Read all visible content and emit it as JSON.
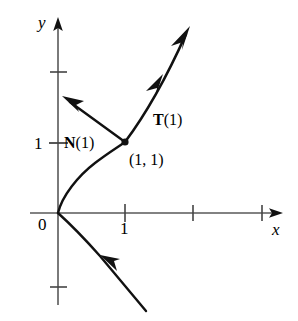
{
  "figure": {
    "background_color": "#ffffff",
    "ink_color": "#000000",
    "axis_color": "#595959",
    "axes": {
      "x_label": "x",
      "y_label": "y",
      "origin_label": "0",
      "x_ticks": [
        {
          "value": 1,
          "label": "1"
        },
        {
          "value": 2,
          "label": ""
        },
        {
          "value": 3,
          "label": ""
        }
      ],
      "y_ticks": [
        {
          "value": 1,
          "label": "1"
        },
        {
          "value": 2,
          "label": ""
        },
        {
          "value": -1,
          "label": ""
        }
      ]
    },
    "point": {
      "label": "(1, 1)",
      "x": 1,
      "y": 1
    },
    "vectors": [
      {
        "name": "tangent",
        "label_html": "<b>T</b>(1)",
        "label_text": "T(1)"
      },
      {
        "name": "normal",
        "label_html": "<b>N</b>(1)",
        "label_text": "N(1)"
      }
    ],
    "curve": {
      "equation": "x = y^2",
      "direction_label": "increasing t"
    }
  },
  "chart_data": {
    "type": "line",
    "xlabel": "x",
    "ylabel": "y",
    "xlim": [
      -0.4,
      3.3
    ],
    "ylim": [
      -1.4,
      2.8
    ],
    "grid": false,
    "legend": null,
    "series": [
      {
        "name": "curve x = y^2 (upper branch)",
        "x": [
          0,
          0.04,
          0.16,
          0.36,
          0.64,
          1.0
        ],
        "y": [
          0,
          0.2,
          0.4,
          0.6,
          0.8,
          1.0
        ]
      },
      {
        "name": "curve x = y^2 (lower branch)",
        "x": [
          0,
          0.09,
          0.36,
          0.81,
          1.44
        ],
        "y": [
          0,
          -0.3,
          -0.6,
          -0.9,
          -1.2
        ]
      }
    ],
    "annotations": [
      {
        "text": "(1, 1)",
        "x": 1.0,
        "y": 1.0,
        "kind": "point-label"
      },
      {
        "text": "T(1)",
        "x": 1.55,
        "y": 1.45,
        "kind": "vector-label"
      },
      {
        "text": "N(1)",
        "x": 0.32,
        "y": 1.0,
        "kind": "vector-label"
      },
      {
        "text": "0",
        "x": 0,
        "y": 0,
        "kind": "origin-label"
      },
      {
        "text": "1",
        "x": 1,
        "y": 0,
        "kind": "x-tick-label"
      },
      {
        "text": "1",
        "x": 0,
        "y": 1,
        "kind": "y-tick-label"
      }
    ],
    "vectors": [
      {
        "name": "T(1)",
        "tail": [
          1.0,
          1.0
        ],
        "head": [
          1.45,
          1.9
        ],
        "unit": true
      },
      {
        "name": "N(1)",
        "tail": [
          1.0,
          1.0
        ],
        "head": [
          0.1,
          1.65
        ],
        "unit": true
      }
    ]
  }
}
